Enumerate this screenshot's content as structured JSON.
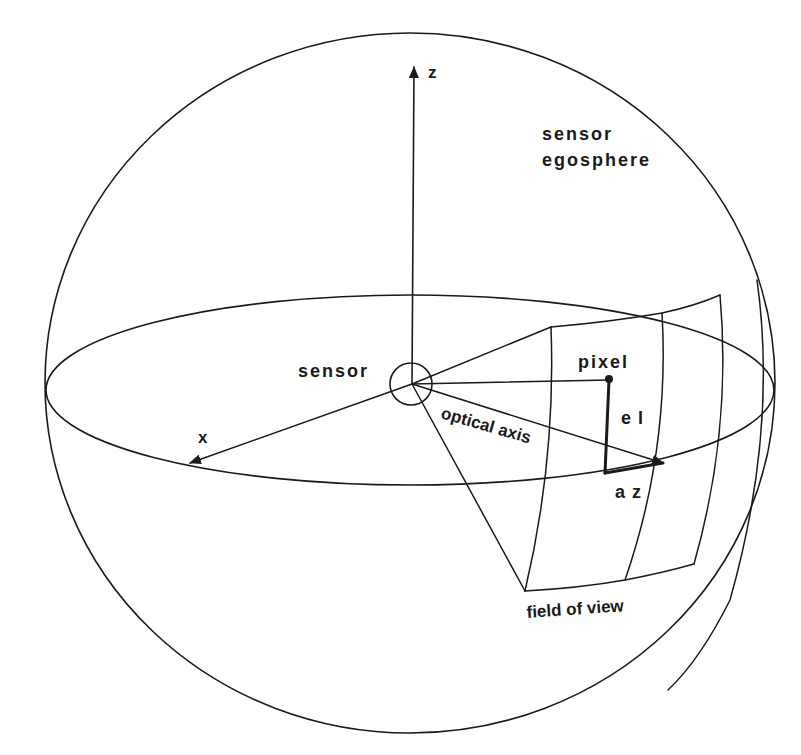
{
  "diagram": {
    "type": "sensor-egosphere-geometry",
    "colors": {
      "ink": "#1a1a1a",
      "background": "#ffffff"
    },
    "labels": {
      "z_axis": "z",
      "x_axis": "x",
      "egosphere_line1": "sensor",
      "egosphere_line2": "egosphere",
      "sensor": "sensor",
      "pixel": "pixel",
      "elevation": "e l",
      "azimuth": "a z",
      "optical_axis": "optical axis",
      "field_of_view": "field of view"
    },
    "nodes": [
      {
        "id": "sphere",
        "label": "sensor egosphere",
        "shape": "ellipse"
      },
      {
        "id": "equator",
        "label": "",
        "shape": "ellipse"
      },
      {
        "id": "sensor",
        "label": "sensor",
        "shape": "circle"
      },
      {
        "id": "pixel",
        "label": "pixel",
        "shape": "dot"
      },
      {
        "id": "fov_patch",
        "label": "field of view",
        "shape": "curved-quad-grid"
      }
    ],
    "edges": [
      {
        "from": "sensor",
        "to": "z",
        "label": "z",
        "arrow": true
      },
      {
        "from": "sensor",
        "to": "x",
        "label": "x",
        "arrow": true
      },
      {
        "from": "sensor",
        "to": "fov_center",
        "label": "optical axis",
        "arrow": true
      },
      {
        "from": "sensor",
        "to": "pixel",
        "label": "",
        "arrow": false
      },
      {
        "from": "pixel",
        "to": "az_corner",
        "label": "el",
        "arrow": false,
        "thick": true
      },
      {
        "from": "az_corner",
        "to": "fov_center",
        "label": "az",
        "arrow": false,
        "thick": true
      },
      {
        "from": "sensor",
        "to": "fov_top_left",
        "label": "",
        "arrow": false
      },
      {
        "from": "sensor",
        "to": "fov_bottom_left",
        "label": "",
        "arrow": false
      }
    ]
  }
}
